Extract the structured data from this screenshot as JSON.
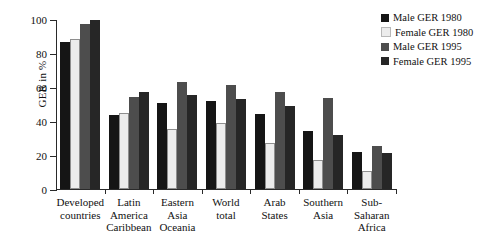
{
  "chart_data": {
    "type": "bar",
    "title": "",
    "xlabel": "",
    "ylabel": "GER in %",
    "ylim": [
      0,
      100
    ],
    "yticks": [
      0,
      20,
      40,
      60,
      80,
      100
    ],
    "grid": false,
    "legend_position": "top-right",
    "categories": [
      "Developed\ncountries",
      "Latin America\nCaribbean",
      "Eastern Asia\nOceania",
      "World\ntotal",
      "Arab\nStates",
      "Southern\nAsia",
      "Sub-Saharan\nAfrica"
    ],
    "series": [
      {
        "name": "Male GER 1980",
        "color": "#151515",
        "values": [
          86.5,
          43.5,
          50.5,
          52.0,
          44.0,
          34.0,
          21.5
        ]
      },
      {
        "name": "Female GER 1980",
        "color": "#ececec",
        "values": [
          88.5,
          44.8,
          35.5,
          39.0,
          26.8,
          16.8,
          10.5
        ]
      },
      {
        "name": "Male GER 1995",
        "color": "#4d4d4d",
        "values": [
          96.8,
          54.3,
          63.0,
          61.0,
          57.0,
          53.8,
          25.5
        ]
      },
      {
        "name": "Female GER 1995",
        "color": "#262626",
        "values": [
          99.7,
          57.3,
          55.3,
          53.0,
          49.0,
          31.5,
          21.3
        ]
      }
    ]
  },
  "legend": {
    "items": [
      {
        "label": "Male GER 1980"
      },
      {
        "label": "Female GER 1980"
      },
      {
        "label": "Male GER 1995"
      },
      {
        "label": "Female GER 1995"
      }
    ]
  }
}
